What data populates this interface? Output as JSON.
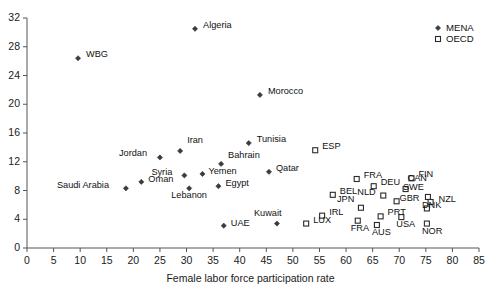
{
  "chart_data": {
    "type": "scatter",
    "title": "",
    "xlabel": "Female labor force participation rate",
    "ylabel": "",
    "xlim": [
      0,
      85
    ],
    "ylim": [
      0,
      32
    ],
    "xticks": [
      0,
      5,
      10,
      15,
      20,
      25,
      30,
      35,
      40,
      45,
      50,
      55,
      60,
      65,
      70,
      75,
      80,
      85
    ],
    "yticks": [
      0,
      4,
      8,
      12,
      16,
      20,
      24,
      28,
      32
    ],
    "grid": false,
    "legend_position": "top-right",
    "series": [
      {
        "name": "MENA",
        "marker": "filled-diamond",
        "color": "#3b3b3b",
        "points": [
          {
            "label": "Algeria",
            "x": 31.6,
            "y": 30.5,
            "lx": 8,
            "ly": -4
          },
          {
            "label": "WBG",
            "x": 9.6,
            "y": 26.4,
            "lx": 8,
            "ly": -4
          },
          {
            "label": "Morocco",
            "x": 43.8,
            "y": 21.3,
            "lx": 8,
            "ly": -4
          },
          {
            "label": "Tunisia",
            "x": 41.7,
            "y": 14.6,
            "lx": 8,
            "ly": -4
          },
          {
            "label": "Iran",
            "x": 28.8,
            "y": 13.5,
            "lx": 7,
            "ly": -11
          },
          {
            "label": "Jordan",
            "x": 25.0,
            "y": 12.6,
            "lx": -41,
            "ly": -4
          },
          {
            "label": "Bahrain",
            "x": 36.5,
            "y": 11.7,
            "lx": 7,
            "ly": -9
          },
          {
            "label": "Qatar",
            "x": 45.5,
            "y": 10.6,
            "lx": 7,
            "ly": -4
          },
          {
            "label": "Yemen",
            "x": 33.0,
            "y": 10.3,
            "lx": 6,
            "ly": -3
          },
          {
            "label": "Syria",
            "x": 29.6,
            "y": 10.1,
            "lx": -33,
            "ly": -3
          },
          {
            "label": "Oman",
            "x": 21.5,
            "y": 9.2,
            "lx": 7,
            "ly": -3
          },
          {
            "label": "Egypt",
            "x": 36.0,
            "y": 8.6,
            "lx": 7,
            "ly": -3
          },
          {
            "label": "Saudi Arabia",
            "x": 18.6,
            "y": 8.3,
            "lx": -69,
            "ly": -3
          },
          {
            "label": "Lebanon",
            "x": 30.5,
            "y": 8.3,
            "lx": -18,
            "ly": 7
          },
          {
            "label": "Kuwait",
            "x": 47.0,
            "y": 3.4,
            "lx": -23,
            "ly": -11
          },
          {
            "label": "UAE",
            "x": 37.0,
            "y": 3.1,
            "lx": 7,
            "ly": -3
          }
        ]
      },
      {
        "name": "OECD",
        "marker": "open-square",
        "color": "#3b3b3b",
        "points": [
          {
            "label": "ESP",
            "x": 54.2,
            "y": 13.6,
            "lx": 7,
            "ly": -4
          },
          {
            "label": "FIN",
            "x": 72.3,
            "y": 9.7,
            "lx": 7,
            "ly": -4
          },
          {
            "label": "FRA",
            "x": 62.0,
            "y": 9.6,
            "lx": 7,
            "ly": -4
          },
          {
            "label": "DEU",
            "x": 65.2,
            "y": 8.6,
            "lx": 7,
            "ly": -4
          },
          {
            "label": "CAN",
            "x": 71.2,
            "y": 8.2,
            "lx": 2,
            "ly": -11
          },
          {
            "label": "BEL",
            "x": 57.5,
            "y": 7.4,
            "lx": 7,
            "ly": -4
          },
          {
            "label": "NLD",
            "x": 67.0,
            "y": 7.3,
            "lx": -26,
            "ly": -4
          },
          {
            "label": "SWE",
            "x": 75.4,
            "y": 7.1,
            "lx": -25,
            "ly": -10
          },
          {
            "label": "GBR",
            "x": 69.5,
            "y": 6.5,
            "lx": 3,
            "ly": -3
          },
          {
            "label": "NZL",
            "x": 75.9,
            "y": 6.4,
            "lx": 8,
            "ly": -3
          },
          {
            "label": "JPN",
            "x": 62.8,
            "y": 5.6,
            "lx": -24,
            "ly": -9
          },
          {
            "label": "DNK",
            "x": 75.2,
            "y": 5.5,
            "lx": -5,
            "ly": -3
          },
          {
            "label": "IRL",
            "x": 55.5,
            "y": 4.5,
            "lx": 7,
            "ly": -4
          },
          {
            "label": "PRT",
            "x": 66.5,
            "y": 4.4,
            "lx": 7,
            "ly": -4
          },
          {
            "label": "USA",
            "x": 70.4,
            "y": 4.3,
            "lx": -5,
            "ly": 7
          },
          {
            "label": "FRA",
            "x": 62.2,
            "y": 3.8,
            "lx": -7,
            "ly": 7
          },
          {
            "label": "LUX",
            "x": 52.5,
            "y": 3.4,
            "lx": 7,
            "ly": -4
          },
          {
            "label": "NOR",
            "x": 75.2,
            "y": 3.4,
            "lx": -5,
            "ly": 7
          },
          {
            "label": "AUS",
            "x": 65.8,
            "y": 3.2,
            "lx": -5,
            "ly": 7
          }
        ]
      }
    ]
  },
  "legend": {
    "items": [
      {
        "label": "MENA",
        "marker": "filled-diamond"
      },
      {
        "label": "OECD",
        "marker": "open-square"
      }
    ]
  }
}
